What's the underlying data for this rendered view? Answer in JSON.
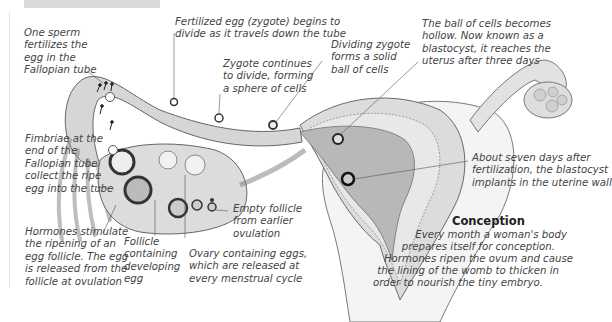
{
  "figure": {
    "title": "Conception",
    "description": [
      "Every month a woman's body",
      "prepares itself for conception.",
      "Hormones ripen the ovum and cause",
      "the lining of the womb to thicken in",
      "order to nourish the tiny embryo."
    ]
  },
  "labels": {
    "sperm": [
      "One sperm",
      "fertilizes the",
      "egg in the",
      "Fallopian tube"
    ],
    "zygote_divide": [
      "Fertilized egg (zygote) begins to",
      "divide as it travels down the tube"
    ],
    "zygote_continues": [
      "Zygote continues",
      "to divide, forming",
      "a sphere of cells"
    ],
    "solid_ball": [
      "Dividing zygote",
      "forms a solid",
      "ball of cells"
    ],
    "blastocyst": [
      "The ball of cells becomes",
      "hollow. Now known as a",
      "blastocyst, it reaches the",
      "uterus after three days"
    ],
    "fimbriae": [
      "Fimbriae at the",
      "end of the",
      "Fallopian tube",
      "collect the ripe",
      "egg into the tube"
    ],
    "implant": [
      "About seven days after",
      "fertilization, the blastocyst",
      "implants in the uterine wall"
    ],
    "hormones": [
      "Hormones stimulate",
      "the ripening of an",
      "egg follicle. The egg",
      "is released from the",
      "follicle at ovulation"
    ],
    "follicle": [
      "Follicle",
      "containing",
      "developing",
      "egg"
    ],
    "empty_follicle": [
      "Empty follicle",
      "from earlier",
      "ovulation"
    ],
    "ovary": [
      "Ovary containing eggs,",
      "which are released at",
      "every menstrual cycle"
    ]
  },
  "colors": {
    "tissue": "#d4d4d4",
    "tissue_dark": "#9a9a9a",
    "lining": "#e6e6e6",
    "cavity": "#b9b9b9",
    "outline": "#6a6a6a",
    "leader": "#555555"
  }
}
